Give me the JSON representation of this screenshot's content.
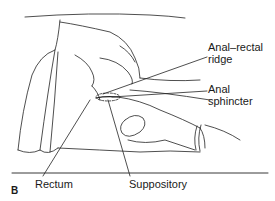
{
  "figure": {
    "panel_label": "B",
    "labels": {
      "anal_rectal_ridge_line1": "Anal–rectal",
      "anal_rectal_ridge_line2": "ridge",
      "anal_sphincter_line1": "Anal",
      "anal_sphincter_line2": "sphincter",
      "rectum": "Rectum",
      "suppository": "Suppository"
    }
  }
}
